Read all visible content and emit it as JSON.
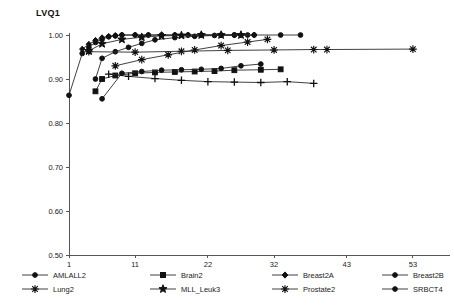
{
  "chart_data": {
    "type": "line",
    "title": "LVQ1",
    "xlabel": "",
    "ylabel": "",
    "xlim": [
      1,
      58
    ],
    "ylim": [
      0.5,
      1.0
    ],
    "xticks": [
      1,
      11,
      22,
      32,
      43,
      53
    ],
    "yticks": [
      "0.50",
      "0.60",
      "0.70",
      "0.80",
      "0.90",
      "1.00"
    ],
    "grid": false,
    "legend_position": "bottom",
    "series": [
      {
        "name": "AMLALL2",
        "marker": "circle",
        "x": [
          1,
          3,
          4,
          5,
          6,
          7,
          8,
          9,
          11,
          13,
          15,
          17,
          19,
          21,
          24,
          26,
          28
        ],
        "y": [
          0.863,
          0.958,
          0.972,
          0.983,
          0.99,
          0.996,
          0.998,
          1.0,
          1.0,
          1.0,
          1.0,
          1.0,
          1.0,
          1.0,
          1.0,
          1.0,
          1.0
        ]
      },
      {
        "name": "Brain2",
        "marker": "square",
        "x": [
          5,
          6,
          8,
          11,
          14,
          17,
          20,
          23,
          26,
          30,
          33
        ],
        "y": [
          0.872,
          0.9,
          0.908,
          0.913,
          0.915,
          0.916,
          0.917,
          0.918,
          0.92,
          0.921,
          0.922
        ]
      },
      {
        "name": "Breast2A",
        "marker": "diamond",
        "x": [
          3,
          4,
          5,
          6,
          7,
          8,
          9,
          11,
          13,
          15,
          17,
          19,
          21,
          24,
          27,
          29
        ],
        "y": [
          0.968,
          0.979,
          0.988,
          0.994,
          0.997,
          0.999,
          1.0,
          1.0,
          1.0,
          1.0,
          1.0,
          1.0,
          1.0,
          1.0,
          1.0,
          1.0
        ]
      },
      {
        "name": "Breast2B",
        "marker": "circle",
        "x": [
          5,
          6,
          8,
          10,
          12,
          14,
          17,
          20,
          23,
          26,
          29,
          33,
          36
        ],
        "y": [
          0.9,
          0.947,
          0.962,
          0.972,
          0.981,
          0.989,
          0.994,
          0.997,
          0.999,
          1.0,
          1.0,
          1.0,
          1.0
        ]
      },
      {
        "name": "Colon2",
        "marker": "plus",
        "x": [
          7,
          10,
          14,
          18,
          22,
          26,
          30,
          34,
          38
        ],
        "y": [
          0.911,
          0.906,
          0.901,
          0.897,
          0.894,
          0.893,
          0.892,
          0.894,
          0.89
        ]
      },
      {
        "name": "Lung2",
        "marker": "asterisk",
        "x": [
          4,
          11,
          18,
          25,
          32,
          38,
          40,
          53
        ],
        "y": [
          0.962,
          0.961,
          0.963,
          0.965,
          0.966,
          0.967,
          0.967,
          0.968
        ]
      },
      {
        "name": "MLL_Leuk3",
        "marker": "star",
        "x": [
          4,
          6,
          9,
          12,
          15,
          18,
          21,
          24,
          27
        ],
        "y": [
          0.964,
          0.98,
          0.99,
          0.995,
          0.998,
          0.999,
          1.0,
          1.0,
          1.0
        ]
      },
      {
        "name": "Prostate2",
        "marker": "asterisk",
        "x": [
          8,
          12,
          16,
          20,
          24,
          28,
          31
        ],
        "y": [
          0.93,
          0.944,
          0.955,
          0.966,
          0.976,
          0.984,
          0.99
        ]
      },
      {
        "name": "SRBCT4",
        "marker": "circle",
        "x": [
          6,
          9,
          12,
          15,
          18,
          21,
          24,
          27,
          30
        ],
        "y": [
          0.855,
          0.913,
          0.917,
          0.92,
          0.921,
          0.922,
          0.924,
          0.93,
          0.934
        ]
      }
    ],
    "legend_rows": [
      [
        "AMLALL2",
        "Brain2",
        "Breast2A",
        "Breast2B",
        "Colon2"
      ],
      [
        "Lung2",
        "MLL_Leuk3",
        "Prostate2",
        "SRBCT4"
      ]
    ]
  }
}
